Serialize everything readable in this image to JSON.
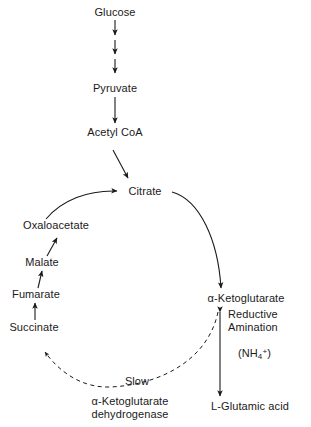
{
  "diagram": {
    "background_color": "#ffffff",
    "text_color": "#1a1a1a",
    "line_color": "#1a1a1a"
  },
  "nodes": {
    "glucose": "Glucose",
    "pyruvate": "Pyruvate",
    "acetyl_coa": "Acetyl CoA",
    "citrate": "Citrate",
    "oxaloacetate": "Oxaloacetate",
    "malate": "Malate",
    "fumarate": "Fumarate",
    "succinate": "Succinate",
    "ketoglutarate": "α-Ketoglutarate",
    "glutamic_acid": "L-Glutamic acid"
  },
  "annotations": {
    "reductive_line1": "Reductive",
    "reductive_line2": "Amination",
    "ammonium_open": "(NH",
    "ammonium_sub": "4",
    "ammonium_sup": "+",
    "ammonium_close": ")",
    "slow": "Slow",
    "enzyme_line1": "α-Ketoglutarate",
    "enzyme_line2": "dehydrogenase"
  },
  "edges": [
    {
      "name": "glucose-to-step1",
      "type": "solid-arrow",
      "from": "glucose",
      "to": "glycolysis-step-1"
    },
    {
      "name": "step1-to-step2",
      "type": "solid-arrow",
      "from": "glycolysis-step-1",
      "to": "glycolysis-step-2"
    },
    {
      "name": "step2-to-pyruvate",
      "type": "solid-arrow",
      "from": "glycolysis-step-2",
      "to": "pyruvate"
    },
    {
      "name": "pyruvate-to-acetyl-coa",
      "type": "solid-arrow",
      "from": "pyruvate",
      "to": "acetyl_coa"
    },
    {
      "name": "acetyl-coa-to-citrate",
      "type": "solid-arrow-diagonal",
      "from": "acetyl_coa",
      "to": "citrate"
    },
    {
      "name": "oxaloacetate-to-citrate",
      "type": "curved-arrow",
      "from": "oxaloacetate",
      "to": "citrate"
    },
    {
      "name": "citrate-to-ketoglutarate",
      "type": "curved-arrow",
      "from": "citrate",
      "to": "ketoglutarate"
    },
    {
      "name": "succinate-to-fumarate",
      "type": "solid-arrow",
      "from": "succinate",
      "to": "fumarate"
    },
    {
      "name": "fumarate-to-malate",
      "type": "solid-arrow",
      "from": "fumarate",
      "to": "malate"
    },
    {
      "name": "malate-to-oxaloacetate",
      "type": "solid-arrow",
      "from": "malate",
      "to": "oxaloacetate"
    },
    {
      "name": "ketoglutarate-to-succinate-slow",
      "type": "dashed-curved-arrow",
      "from": "ketoglutarate",
      "to": "succinate",
      "label": "Slow"
    },
    {
      "name": "ketoglutarate-glutamate-reversible",
      "type": "double-headed-arrow",
      "from": "ketoglutarate",
      "to": "glutamic_acid"
    }
  ]
}
